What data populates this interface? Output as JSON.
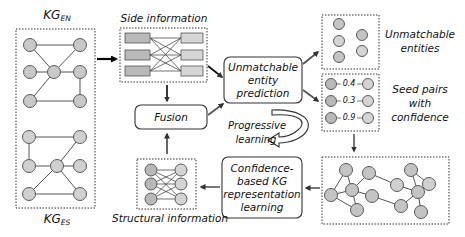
{
  "diagram": {
    "kg_source": {
      "base": "KG",
      "subscript": "EN"
    },
    "kg_target": {
      "base": "KG",
      "subscript": "ES"
    },
    "side_information": "Side information",
    "structural_information": "Structural information",
    "fusion": "Fusion",
    "unmatchable_prediction": {
      "line1": "Unmatchable",
      "line2": "entity",
      "line3": "prediction"
    },
    "unmatchable_entities": {
      "line1": "Unmatchable",
      "line2": "entities"
    },
    "seed_pairs": {
      "line1": "Seed pairs",
      "line2": "with",
      "line3": "confidence"
    },
    "seed_confidences": [
      "0.4",
      "0.3",
      "0.9"
    ],
    "progressive_learning": {
      "line1": "Progressive",
      "line2": "learning"
    },
    "confidence_learning": {
      "line1": "Confidence-",
      "line2": "based KG",
      "line3": "representation",
      "line4": "learning"
    },
    "colors": {
      "node_fill": "#c8c8c8",
      "node_stroke": "#5a5a5a",
      "box_fill": "#b9b9b9",
      "box_fill_light": "#d4d4d4",
      "arrow": "#333333",
      "arrow_dark": "#000000"
    }
  }
}
